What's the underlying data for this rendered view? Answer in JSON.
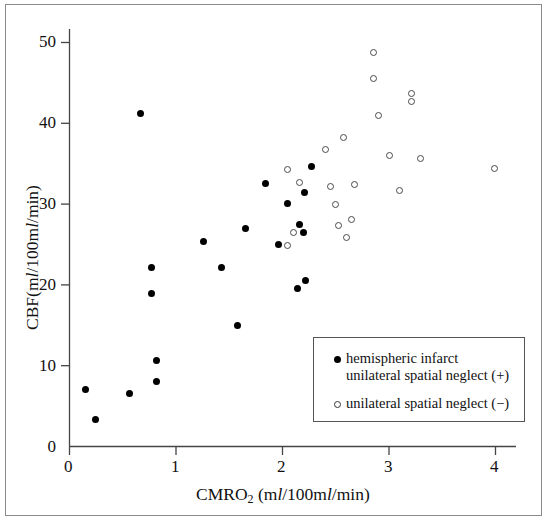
{
  "chart_data": {
    "type": "scatter",
    "title": "",
    "xlabel": "CMRO2 (ml/100ml/min)",
    "ylabel": "CBF (ml/100ml/min)",
    "xlim": [
      0,
      4.25
    ],
    "ylim": [
      0,
      52
    ],
    "xticks": [
      0,
      1,
      2,
      3,
      4
    ],
    "yticks": [
      0,
      10,
      20,
      30,
      40,
      50
    ],
    "xtick_labels": [
      "0",
      "1",
      "2",
      "3",
      "4"
    ],
    "ytick_labels": [
      "0",
      "10",
      "20",
      "30",
      "40",
      "50"
    ],
    "grid": false,
    "legend_position": "lower-right",
    "series": [
      {
        "name": "hemispheric infarct unilateral spatial neglect (+)",
        "marker": "filled-circle",
        "color": "#000000",
        "points": [
          [
            0.15,
            7.0
          ],
          [
            0.24,
            3.4
          ],
          [
            0.56,
            6.5
          ],
          [
            0.67,
            41.2
          ],
          [
            0.77,
            22.2
          ],
          [
            0.77,
            18.9
          ],
          [
            0.82,
            10.7
          ],
          [
            0.82,
            8.0
          ],
          [
            1.26,
            25.4
          ],
          [
            1.43,
            22.1
          ],
          [
            1.58,
            15.0
          ],
          [
            1.65,
            27.0
          ],
          [
            1.84,
            32.6
          ],
          [
            1.96,
            25.0
          ],
          [
            2.05,
            30.1
          ],
          [
            2.14,
            19.6
          ],
          [
            2.16,
            27.5
          ],
          [
            2.2,
            26.5
          ],
          [
            2.21,
            31.4
          ],
          [
            2.22,
            20.5
          ],
          [
            2.27,
            34.7
          ]
        ]
      },
      {
        "name": "unilateral spatial neglect (-)",
        "marker": "open-circle",
        "color": "#4a4a4a",
        "points": [
          [
            2.05,
            34.3
          ],
          [
            2.05,
            24.9
          ],
          [
            2.1,
            26.5
          ],
          [
            2.16,
            32.7
          ],
          [
            2.4,
            36.8
          ],
          [
            2.45,
            32.2
          ],
          [
            2.5,
            30.0
          ],
          [
            2.53,
            27.4
          ],
          [
            2.57,
            38.2
          ],
          [
            2.6,
            25.9
          ],
          [
            2.65,
            28.1
          ],
          [
            2.68,
            32.4
          ],
          [
            2.85,
            48.8
          ],
          [
            2.85,
            45.6
          ],
          [
            2.9,
            41.0
          ],
          [
            3.0,
            36.0
          ],
          [
            3.1,
            31.7
          ],
          [
            3.21,
            43.7
          ],
          [
            3.21,
            42.7
          ],
          [
            3.3,
            35.7
          ],
          [
            3.99,
            34.4
          ]
        ]
      }
    ]
  },
  "axes": {
    "y_label_main": "CBF",
    "y_label_unit": "(ml/100ml/min)",
    "x_label_main": "CMRO",
    "x_label_sub": "2",
    "x_label_unit": "(ml/100ml/min)"
  },
  "legend": {
    "entry1_line1": "hemispheric infarct",
    "entry1_line2": "unilateral spatial neglect (+)",
    "entry2_line1": "unilateral spatial neglect (−)"
  }
}
